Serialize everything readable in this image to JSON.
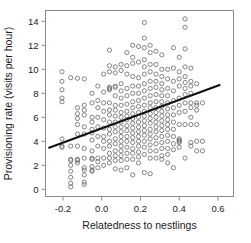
{
  "chart_data": {
    "type": "scatter",
    "title": "",
    "xlabel": "Relatedness to nestlings",
    "ylabel": "Provisioning rate (visits per hour)",
    "xlim": [
      -0.29,
      0.68
    ],
    "ylim": [
      -0.6,
      14.9
    ],
    "xticks": [
      -0.2,
      0.0,
      0.2,
      0.4,
      0.6
    ],
    "xticklabels": [
      "-0.2",
      "0.0",
      "0.2",
      "0.4",
      "0.6"
    ],
    "yticks": [
      0,
      2,
      4,
      6,
      8,
      10,
      12,
      14
    ],
    "yticklabels": [
      "0",
      "2",
      "4",
      "6",
      "8",
      "10",
      "12",
      "14"
    ],
    "grid": false,
    "legend": null,
    "marker": "open-circle",
    "marker_color": "#6e6e6e",
    "marker_radius": 2.1,
    "frame_color": "#8a8a8a",
    "trend_line": {
      "name": "regression-line",
      "color": "#111111",
      "x_start": -0.275,
      "y_start": 3.45,
      "x_end": 0.612,
      "y_end": 8.72
    },
    "points": [
      [
        -0.205,
        9.8
      ],
      [
        -0.205,
        9.0
      ],
      [
        -0.205,
        8.3
      ],
      [
        -0.205,
        7.6
      ],
      [
        -0.205,
        7.3
      ],
      [
        -0.205,
        4.2
      ],
      [
        -0.205,
        3.6
      ],
      [
        -0.205,
        3.5
      ],
      [
        -0.16,
        9.3
      ],
      [
        -0.16,
        3.6
      ],
      [
        -0.16,
        2.5
      ],
      [
        -0.16,
        2.4
      ],
      [
        -0.16,
        2.0
      ],
      [
        -0.16,
        1.5
      ],
      [
        -0.16,
        1.0
      ],
      [
        -0.16,
        0.5
      ],
      [
        -0.16,
        0.2
      ],
      [
        -0.125,
        9.25
      ],
      [
        -0.125,
        6.8
      ],
      [
        -0.125,
        6.3
      ],
      [
        -0.125,
        5.9
      ],
      [
        -0.125,
        5.4
      ],
      [
        -0.125,
        4.6
      ],
      [
        -0.125,
        3.6
      ],
      [
        -0.125,
        2.5
      ],
      [
        -0.125,
        2.4
      ],
      [
        -0.125,
        2.2
      ],
      [
        -0.09,
        9.2
      ],
      [
        -0.09,
        7.0
      ],
      [
        -0.09,
        6.6
      ],
      [
        -0.09,
        6.2
      ],
      [
        -0.09,
        5.2
      ],
      [
        -0.09,
        4.6
      ],
      [
        -0.09,
        3.4
      ],
      [
        -0.09,
        2.6
      ],
      [
        -0.09,
        1.8
      ],
      [
        -0.09,
        1.6
      ],
      [
        -0.09,
        1.2
      ],
      [
        -0.09,
        0.6
      ],
      [
        -0.09,
        0.4
      ],
      [
        -0.05,
        8.0
      ],
      [
        -0.05,
        7.2
      ],
      [
        -0.05,
        6.0
      ],
      [
        -0.05,
        5.6
      ],
      [
        -0.05,
        5.0
      ],
      [
        -0.05,
        4.7
      ],
      [
        -0.05,
        4.1
      ],
      [
        -0.05,
        3.2
      ],
      [
        -0.05,
        2.6
      ],
      [
        -0.05,
        2.5
      ],
      [
        -0.05,
        1.9
      ],
      [
        -0.05,
        1.6
      ],
      [
        -0.05,
        1.5
      ],
      [
        -0.02,
        8.6
      ],
      [
        -0.02,
        7.4
      ],
      [
        -0.02,
        6.8
      ],
      [
        -0.02,
        6.0
      ],
      [
        -0.02,
        5.2
      ],
      [
        -0.02,
        4.4
      ],
      [
        -0.02,
        3.6
      ],
      [
        -0.02,
        2.6
      ],
      [
        -0.02,
        2.3
      ],
      [
        -0.02,
        1.8
      ],
      [
        0.01,
        9.6
      ],
      [
        0.01,
        8.1
      ],
      [
        0.01,
        7.2
      ],
      [
        0.01,
        6.5
      ],
      [
        0.01,
        5.8
      ],
      [
        0.01,
        5.1
      ],
      [
        0.01,
        4.4
      ],
      [
        0.01,
        4.0
      ],
      [
        0.01,
        3.4
      ],
      [
        0.01,
        2.6
      ],
      [
        0.01,
        2.0
      ],
      [
        0.04,
        11.6
      ],
      [
        0.04,
        10.3
      ],
      [
        0.04,
        9.8
      ],
      [
        0.04,
        8.5
      ],
      [
        0.04,
        8.4
      ],
      [
        0.04,
        8.3
      ],
      [
        0.04,
        7.2
      ],
      [
        0.04,
        6.6
      ],
      [
        0.04,
        6.2
      ],
      [
        0.04,
        5.6
      ],
      [
        0.04,
        5.0
      ],
      [
        0.04,
        4.6
      ],
      [
        0.04,
        4.0
      ],
      [
        0.04,
        3.6
      ],
      [
        0.04,
        3.0
      ],
      [
        0.04,
        2.6
      ],
      [
        0.04,
        2.2
      ],
      [
        0.07,
        10.2
      ],
      [
        0.07,
        9.7
      ],
      [
        0.07,
        8.6
      ],
      [
        0.07,
        8.5
      ],
      [
        0.07,
        7.8
      ],
      [
        0.07,
        7.0
      ],
      [
        0.07,
        6.6
      ],
      [
        0.07,
        6.1
      ],
      [
        0.07,
        5.6
      ],
      [
        0.07,
        5.2
      ],
      [
        0.07,
        4.8
      ],
      [
        0.07,
        4.2
      ],
      [
        0.07,
        3.8
      ],
      [
        0.07,
        3.2
      ],
      [
        0.07,
        2.8
      ],
      [
        0.07,
        2.4
      ],
      [
        0.07,
        1.7
      ],
      [
        0.1,
        10.4
      ],
      [
        0.1,
        9.9
      ],
      [
        0.1,
        8.8
      ],
      [
        0.1,
        8.2
      ],
      [
        0.1,
        7.6
      ],
      [
        0.1,
        7.0
      ],
      [
        0.1,
        6.4
      ],
      [
        0.1,
        6.0
      ],
      [
        0.1,
        5.6
      ],
      [
        0.1,
        5.2
      ],
      [
        0.1,
        4.8
      ],
      [
        0.1,
        4.4
      ],
      [
        0.1,
        4.0
      ],
      [
        0.1,
        3.6
      ],
      [
        0.1,
        3.2
      ],
      [
        0.1,
        2.8
      ],
      [
        0.1,
        2.4
      ],
      [
        0.1,
        1.6
      ],
      [
        0.13,
        11.4
      ],
      [
        0.13,
        10.3
      ],
      [
        0.13,
        9.6
      ],
      [
        0.13,
        8.4
      ],
      [
        0.13,
        7.8
      ],
      [
        0.13,
        7.1
      ],
      [
        0.13,
        6.5
      ],
      [
        0.13,
        6.1
      ],
      [
        0.13,
        5.8
      ],
      [
        0.13,
        5.3
      ],
      [
        0.13,
        4.9
      ],
      [
        0.13,
        4.4
      ],
      [
        0.13,
        4.0
      ],
      [
        0.13,
        3.5
      ],
      [
        0.13,
        3.0
      ],
      [
        0.13,
        2.5
      ],
      [
        0.13,
        1.8
      ],
      [
        0.16,
        12.0
      ],
      [
        0.16,
        11.0
      ],
      [
        0.16,
        10.5
      ],
      [
        0.16,
        9.4
      ],
      [
        0.16,
        8.6
      ],
      [
        0.16,
        8.0
      ],
      [
        0.16,
        7.3
      ],
      [
        0.16,
        6.8
      ],
      [
        0.16,
        6.3
      ],
      [
        0.16,
        5.9
      ],
      [
        0.16,
        5.5
      ],
      [
        0.16,
        5.1
      ],
      [
        0.16,
        4.7
      ],
      [
        0.16,
        4.3
      ],
      [
        0.16,
        3.9
      ],
      [
        0.16,
        3.4
      ],
      [
        0.16,
        3.0
      ],
      [
        0.16,
        2.5
      ],
      [
        0.16,
        1.2
      ],
      [
        0.19,
        11.9
      ],
      [
        0.19,
        10.6
      ],
      [
        0.19,
        9.3
      ],
      [
        0.19,
        8.6
      ],
      [
        0.19,
        8.0
      ],
      [
        0.19,
        7.4
      ],
      [
        0.19,
        6.9
      ],
      [
        0.19,
        6.4
      ],
      [
        0.19,
        6.0
      ],
      [
        0.19,
        5.6
      ],
      [
        0.19,
        5.2
      ],
      [
        0.19,
        4.8
      ],
      [
        0.19,
        4.4
      ],
      [
        0.19,
        4.0
      ],
      [
        0.19,
        3.6
      ],
      [
        0.19,
        3.1
      ],
      [
        0.19,
        2.7
      ],
      [
        0.19,
        2.2
      ],
      [
        0.22,
        13.9
      ],
      [
        0.22,
        12.6
      ],
      [
        0.22,
        11.8
      ],
      [
        0.22,
        10.8
      ],
      [
        0.22,
        10.2
      ],
      [
        0.22,
        9.6
      ],
      [
        0.22,
        8.8
      ],
      [
        0.22,
        8.2
      ],
      [
        0.22,
        7.6
      ],
      [
        0.22,
        7.0
      ],
      [
        0.22,
        6.5
      ],
      [
        0.22,
        6.1
      ],
      [
        0.22,
        5.7
      ],
      [
        0.22,
        5.3
      ],
      [
        0.22,
        4.9
      ],
      [
        0.22,
        4.5
      ],
      [
        0.22,
        4.0
      ],
      [
        0.22,
        3.5
      ],
      [
        0.22,
        2.9
      ],
      [
        0.22,
        1.4
      ],
      [
        0.25,
        12.0
      ],
      [
        0.25,
        11.4
      ],
      [
        0.25,
        10.4
      ],
      [
        0.25,
        9.8
      ],
      [
        0.25,
        9.0
      ],
      [
        0.25,
        8.4
      ],
      [
        0.25,
        7.8
      ],
      [
        0.25,
        7.2
      ],
      [
        0.25,
        6.8
      ],
      [
        0.25,
        6.3
      ],
      [
        0.25,
        5.9
      ],
      [
        0.25,
        5.5
      ],
      [
        0.25,
        5.0
      ],
      [
        0.25,
        4.6
      ],
      [
        0.25,
        4.2
      ],
      [
        0.25,
        3.7
      ],
      [
        0.25,
        3.2
      ],
      [
        0.25,
        2.6
      ],
      [
        0.25,
        1.3
      ],
      [
        0.28,
        11.5
      ],
      [
        0.28,
        10.4
      ],
      [
        0.28,
        9.6
      ],
      [
        0.28,
        9.0
      ],
      [
        0.28,
        8.5
      ],
      [
        0.28,
        7.9
      ],
      [
        0.28,
        7.3
      ],
      [
        0.28,
        6.8
      ],
      [
        0.28,
        6.4
      ],
      [
        0.28,
        6.0
      ],
      [
        0.28,
        5.6
      ],
      [
        0.28,
        5.2
      ],
      [
        0.28,
        4.8
      ],
      [
        0.28,
        4.3
      ],
      [
        0.28,
        3.8
      ],
      [
        0.28,
        3.2
      ],
      [
        0.28,
        2.6
      ],
      [
        0.31,
        11.2
      ],
      [
        0.31,
        10.0
      ],
      [
        0.31,
        9.4
      ],
      [
        0.31,
        8.8
      ],
      [
        0.31,
        8.3
      ],
      [
        0.31,
        7.8
      ],
      [
        0.31,
        7.3
      ],
      [
        0.31,
        6.9
      ],
      [
        0.31,
        6.5
      ],
      [
        0.31,
        6.1
      ],
      [
        0.31,
        5.7
      ],
      [
        0.31,
        5.3
      ],
      [
        0.31,
        4.9
      ],
      [
        0.31,
        4.4
      ],
      [
        0.31,
        3.9
      ],
      [
        0.31,
        3.4
      ],
      [
        0.31,
        2.8
      ],
      [
        0.31,
        2.5
      ],
      [
        0.34,
        10.0
      ],
      [
        0.34,
        9.2
      ],
      [
        0.34,
        8.4
      ],
      [
        0.34,
        7.8
      ],
      [
        0.34,
        7.2
      ],
      [
        0.34,
        6.7
      ],
      [
        0.34,
        6.2
      ],
      [
        0.34,
        5.8
      ],
      [
        0.34,
        5.4
      ],
      [
        0.34,
        5.0
      ],
      [
        0.34,
        4.5
      ],
      [
        0.34,
        4.0
      ],
      [
        0.34,
        3.4
      ],
      [
        0.34,
        2.9
      ],
      [
        0.34,
        2.2
      ],
      [
        0.37,
        11.8
      ],
      [
        0.37,
        10.1
      ],
      [
        0.37,
        9.0
      ],
      [
        0.37,
        8.2
      ],
      [
        0.37,
        7.4
      ],
      [
        0.37,
        6.8
      ],
      [
        0.37,
        6.2
      ],
      [
        0.37,
        5.6
      ],
      [
        0.37,
        5.0
      ],
      [
        0.37,
        4.4
      ],
      [
        0.37,
        3.8
      ],
      [
        0.37,
        3.3
      ],
      [
        0.37,
        1.8
      ],
      [
        0.4,
        11.0
      ],
      [
        0.4,
        9.8
      ],
      [
        0.4,
        9.2
      ],
      [
        0.4,
        8.6
      ],
      [
        0.4,
        7.6
      ],
      [
        0.4,
        7.0
      ],
      [
        0.4,
        6.4
      ],
      [
        0.4,
        5.4
      ],
      [
        0.4,
        4.2
      ],
      [
        0.4,
        4.1
      ],
      [
        0.4,
        4.0
      ],
      [
        0.4,
        3.9
      ],
      [
        0.4,
        3.5
      ],
      [
        0.43,
        14.2
      ],
      [
        0.43,
        13.5
      ],
      [
        0.43,
        11.7
      ],
      [
        0.43,
        10.2
      ],
      [
        0.43,
        9.4
      ],
      [
        0.43,
        8.9
      ],
      [
        0.43,
        8.4
      ],
      [
        0.43,
        7.9
      ],
      [
        0.43,
        7.2
      ],
      [
        0.43,
        6.5
      ],
      [
        0.43,
        5.4
      ],
      [
        0.43,
        2.6
      ],
      [
        0.46,
        10.1
      ],
      [
        0.46,
        9.0
      ],
      [
        0.46,
        8.6
      ],
      [
        0.46,
        8.0
      ],
      [
        0.46,
        7.2
      ],
      [
        0.46,
        6.8
      ],
      [
        0.46,
        6.0
      ],
      [
        0.46,
        5.4
      ],
      [
        0.46,
        3.9
      ],
      [
        0.46,
        3.6
      ],
      [
        0.49,
        8.8
      ],
      [
        0.49,
        7.2
      ],
      [
        0.49,
        7.0
      ],
      [
        0.49,
        6.6
      ],
      [
        0.49,
        5.4
      ],
      [
        0.49,
        4.0
      ],
      [
        0.49,
        3.2
      ],
      [
        0.52,
        7.2
      ],
      [
        0.52,
        4.0
      ],
      [
        0.52,
        3.2
      ]
    ]
  }
}
